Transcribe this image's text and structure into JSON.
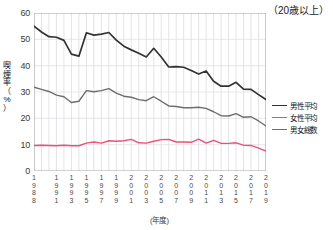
{
  "annotation": "（20歳以上）",
  "axes": {
    "y_label_chars": [
      "喫",
      "煙",
      "率",
      "（",
      "%",
      "）"
    ],
    "y_ticks": [
      "60",
      "50",
      "40",
      "30",
      "20",
      "10",
      "0"
    ],
    "x_axis_title": "(年度)"
  },
  "legend": {
    "items": [
      {
        "label": "男性平均",
        "color": "#333333",
        "key": "male"
      },
      {
        "label": "女性平均",
        "color": "#e8527a",
        "key": "female"
      },
      {
        "label": "男女総数",
        "color": "#6e6e6e",
        "key": "total"
      }
    ]
  },
  "chart_data": {
    "type": "line",
    "title": "",
    "subtitle": "",
    "annotation": "（20歳以上）",
    "xlabel": "(年度)",
    "ylabel": "喫煙率（%）",
    "ylim": [
      0,
      60
    ],
    "yticks": [
      0,
      10,
      20,
      30,
      40,
      50,
      60
    ],
    "grid": true,
    "legend_position": "right",
    "x": [
      1988,
      1989,
      1990,
      1991,
      1992,
      1993,
      1994,
      1995,
      1996,
      1997,
      1998,
      1999,
      2000,
      2001,
      2002,
      2003,
      2004,
      2005,
      2006,
      2007,
      2008,
      2009,
      2010,
      2011,
      2012,
      2013,
      2014,
      2015,
      2016,
      2017,
      2018,
      2019
    ],
    "x_tick_labels": [
      "1988",
      "1991",
      "1993",
      "1995",
      "1997",
      "1999",
      "2001",
      "2003",
      "2005",
      "2007",
      "2009",
      "2011",
      "2013",
      "2015",
      "2017",
      "2019"
    ],
    "x_tick_values": [
      1988,
      1991,
      1993,
      1995,
      1997,
      1999,
      2001,
      2003,
      2005,
      2007,
      2009,
      2011,
      2013,
      2015,
      2017,
      2019
    ],
    "series": [
      {
        "name": "男性平均",
        "color": "#333333",
        "values": [
          55.0,
          52.8,
          51.0,
          50.8,
          49.6,
          44.4,
          43.6,
          52.5,
          51.6,
          52.0,
          52.6,
          49.7,
          47.4,
          46.0,
          44.7,
          43.3,
          46.6,
          43.3,
          39.5,
          39.6,
          39.4,
          38.2,
          36.8,
          38.0,
          34.1,
          32.2,
          32.2,
          33.7,
          31.1,
          31.0,
          29.0,
          27.1
        ]
      },
      {
        "name": "女性平均",
        "color": "#e8527a",
        "values": [
          9.7,
          9.8,
          9.7,
          9.6,
          9.8,
          9.6,
          9.6,
          10.6,
          11.0,
          10.6,
          11.5,
          11.3,
          11.5,
          12.0,
          10.7,
          10.6,
          11.3,
          11.9,
          12.0,
          11.0,
          11.0,
          10.9,
          12.1,
          10.6,
          11.6,
          10.5,
          10.5,
          10.7,
          9.8,
          9.7,
          8.7,
          7.6
        ]
      },
      {
        "name": "男女総数",
        "color": "#6e6e6e",
        "values": [
          31.8,
          31.0,
          30.2,
          28.8,
          28.2,
          26.0,
          26.5,
          30.5,
          30.1,
          30.5,
          31.3,
          29.6,
          28.4,
          28.0,
          27.1,
          26.7,
          28.2,
          26.5,
          24.7,
          24.5,
          24.0,
          24.0,
          24.2,
          23.8,
          22.5,
          21.0,
          20.9,
          21.8,
          20.4,
          20.6,
          19.0,
          17.1
        ]
      }
    ]
  }
}
